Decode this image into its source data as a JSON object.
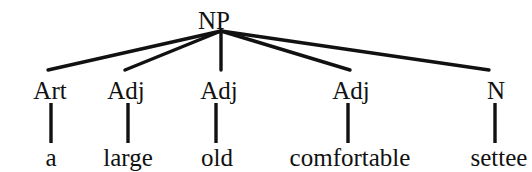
{
  "figure": {
    "kind": "syntax-tree",
    "phrase": "a large old comfortable settee",
    "background_color": "#ffffff",
    "line_color": "#111111",
    "text_color": "#111111"
  },
  "root": {
    "label": "NP",
    "x": 214,
    "y": 8,
    "apex_x": 221,
    "apex_y": 31
  },
  "nodes": [
    {
      "pos": "Art",
      "word": "a",
      "pos_x": 50,
      "pos_y": 78,
      "word_x": 51,
      "word_y": 145,
      "branch_end_x": 48,
      "branch_end_y": 70,
      "stem_x": 51,
      "stem_top": 103,
      "stem_bottom": 143
    },
    {
      "pos": "Adj",
      "word": "large",
      "pos_x": 126,
      "pos_y": 78,
      "word_x": 128,
      "word_y": 145,
      "branch_end_x": 125,
      "branch_end_y": 70,
      "stem_x": 128,
      "stem_top": 103,
      "stem_bottom": 143
    },
    {
      "pos": "Adj",
      "word": "old",
      "pos_x": 219,
      "pos_y": 78,
      "word_x": 217,
      "word_y": 145,
      "branch_end_x": 221,
      "branch_end_y": 70,
      "stem_x": 216,
      "stem_top": 103,
      "stem_bottom": 143
    },
    {
      "pos": "Adj",
      "word": "comfortable",
      "pos_x": 351,
      "pos_y": 78,
      "word_x": 350,
      "word_y": 145,
      "branch_end_x": 350,
      "branch_end_y": 70,
      "stem_x": 348,
      "stem_top": 103,
      "stem_bottom": 143
    },
    {
      "pos": "N",
      "word": "settee",
      "pos_x": 496,
      "pos_y": 78,
      "word_x": 499,
      "word_y": 145,
      "branch_end_x": 489,
      "branch_end_y": 70,
      "stem_x": 495,
      "stem_top": 103,
      "stem_bottom": 143
    }
  ]
}
